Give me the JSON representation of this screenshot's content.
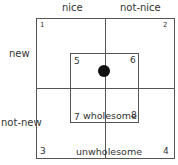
{
  "diagram": {
    "column_labels": [
      "nice",
      "not-nice"
    ],
    "row_labels": [
      "new",
      "not-new"
    ],
    "quadrant_numbers": [
      "1",
      "2",
      "3",
      "4"
    ],
    "inner_numbers": [
      "5",
      "6",
      "7",
      "8"
    ],
    "inner_label": "wholesome",
    "outer_label": "unwholesome",
    "marker": "filled-circle"
  }
}
